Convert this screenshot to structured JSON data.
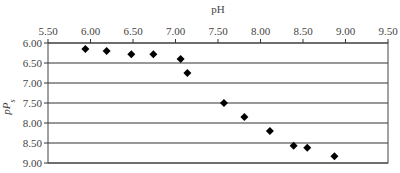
{
  "chart_data": {
    "type": "scatter",
    "title": "",
    "xlabel": "pH",
    "ylabel": "pP_s",
    "ylabel_main": "pP",
    "ylabel_sub": "s",
    "xlim": [
      5.5,
      9.5
    ],
    "ylim": [
      6.0,
      9.0
    ],
    "y_inverted": true,
    "x_axis_position": "top",
    "grid": {
      "horizontal": true,
      "vertical": false
    },
    "legend": null,
    "x_ticks": [
      "5.50",
      "6.00",
      "6.50",
      "7.00",
      "7.50",
      "8.00",
      "8.50",
      "9.00",
      "9.50"
    ],
    "y_ticks": [
      "6.00",
      "6.50",
      "7.00",
      "7.50",
      "8.00",
      "8.50",
      "9.00"
    ],
    "series": [
      {
        "name": "pP_s vs pH",
        "marker": "diamond",
        "color": "#000000",
        "points": [
          {
            "x": 5.94,
            "y": 6.15
          },
          {
            "x": 6.19,
            "y": 6.2
          },
          {
            "x": 6.48,
            "y": 6.28
          },
          {
            "x": 6.74,
            "y": 6.28
          },
          {
            "x": 7.06,
            "y": 6.4
          },
          {
            "x": 7.14,
            "y": 6.75
          },
          {
            "x": 7.57,
            "y": 7.5
          },
          {
            "x": 7.81,
            "y": 7.85
          },
          {
            "x": 8.11,
            "y": 8.2
          },
          {
            "x": 8.39,
            "y": 8.57
          },
          {
            "x": 8.55,
            "y": 8.62
          },
          {
            "x": 8.87,
            "y": 8.83
          }
        ]
      }
    ]
  }
}
